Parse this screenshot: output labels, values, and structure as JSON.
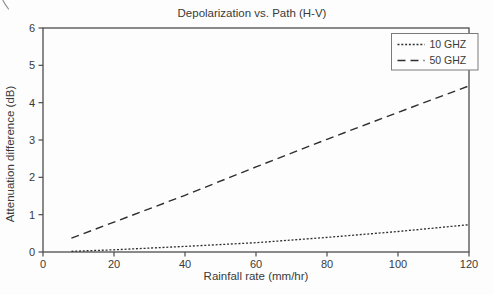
{
  "figure": {
    "scan_artifact": "corner-pen-mark"
  },
  "chart_data": {
    "type": "line",
    "title": "Depolarization vs. Path (H-V)",
    "xlabel": "Rainfall rate (mm/hr)",
    "ylabel": "Attenuation difference (dB)",
    "xlim": [
      0,
      120
    ],
    "ylim": [
      0,
      6
    ],
    "xticks": [
      0,
      20,
      40,
      60,
      80,
      100,
      120
    ],
    "yticks": [
      0,
      1,
      2,
      3,
      4,
      5,
      6
    ],
    "grid": false,
    "legend_position": "top-right",
    "series": [
      {
        "name": "10 GHZ",
        "line_style": "dotted",
        "dash": "2 1.8",
        "stroke_width": 1.3,
        "points": [
          [
            8,
            0.02
          ],
          [
            20,
            0.06
          ],
          [
            40,
            0.15
          ],
          [
            60,
            0.25
          ],
          [
            80,
            0.39
          ],
          [
            100,
            0.55
          ],
          [
            120,
            0.73
          ]
        ]
      },
      {
        "name": "50 GHZ",
        "line_style": "dashed",
        "dash": "8 5",
        "stroke_width": 1.4,
        "points": [
          [
            8,
            0.37
          ],
          [
            20,
            0.8
          ],
          [
            40,
            1.52
          ],
          [
            60,
            2.28
          ],
          [
            80,
            3.02
          ],
          [
            100,
            3.74
          ],
          [
            120,
            4.45
          ]
        ]
      }
    ],
    "colors": {
      "line": "#2e2e2e",
      "axis": "#4d4d4d",
      "text": "#3a3a3a",
      "legend_border": "#7a7a7a",
      "background": "#fdfdfd"
    }
  }
}
